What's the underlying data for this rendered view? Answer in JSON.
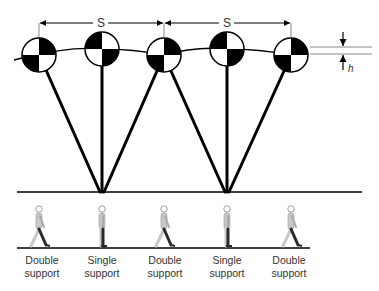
{
  "diagram": {
    "dimensions": {
      "step_length_label": "S",
      "height_label": "h"
    },
    "markers": [
      {
        "id": 1,
        "phase": "Double support",
        "pattern": "tr-bl"
      },
      {
        "id": 2,
        "phase": "Single support",
        "pattern": "tl-br"
      },
      {
        "id": 3,
        "phase": "Double support",
        "pattern": "tr-bl"
      },
      {
        "id": 4,
        "phase": "Single support",
        "pattern": "tl-br"
      },
      {
        "id": 5,
        "phase": "Double support",
        "pattern": "tr-bl"
      }
    ],
    "phases": [
      {
        "line1": "Double",
        "line2": "support"
      },
      {
        "line1": "Single",
        "line2": "support"
      },
      {
        "line1": "Double",
        "line2": "support"
      },
      {
        "line1": "Single",
        "line2": "support"
      },
      {
        "line1": "Double",
        "line2": "support"
      }
    ],
    "colors": {
      "ink": "#000000",
      "figure_light": "#c8c8c8",
      "figure_dark": "#2a2a2a",
      "label": "#333333"
    }
  }
}
